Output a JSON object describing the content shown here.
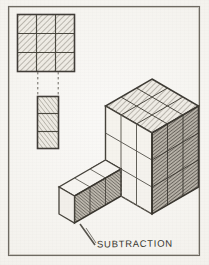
{
  "sheet": {
    "medium": "pencil-on-paper",
    "paper_color": "#f3f1ec",
    "ink_color": "#3a3832",
    "border_color": "#6b675f"
  },
  "caption": {
    "text": "SUBTRACTION",
    "x": 97,
    "y": 238
  },
  "figures": {
    "plan_square": {
      "label": "plan-3x3-square",
      "grid_cols": 3,
      "grid_rows": 3,
      "x": 17,
      "y": 14,
      "w": 58,
      "h": 58,
      "fill": "hatched"
    },
    "removed_strip": {
      "label": "removed-1x3-strip",
      "grid_cols": 1,
      "grid_rows": 3,
      "x": 37,
      "y": 96,
      "w": 22,
      "h": 53,
      "fill": "hatched"
    },
    "connectors": {
      "label": "dashed-projection-lines",
      "count": 2,
      "style": "dashed",
      "x1": 38,
      "x2": 58,
      "y_top": 72,
      "y_bottom": 96
    },
    "isometric_mass": {
      "label": "isometric-cube-with-subtraction",
      "top_face": {
        "grid": "3x3",
        "fill": "hatched-light"
      },
      "right_face": {
        "grid": "3x3",
        "fill": "hatched-dark"
      },
      "left_face": {
        "grid": "3x3",
        "fill": "outline-only"
      },
      "subtracted_wing": {
        "grid": "3x1",
        "front_face": "hatched-dark",
        "top_face": "outline-only"
      }
    }
  },
  "frame": {
    "label": "drawing-border",
    "x": 8,
    "y": 6,
    "w": 192,
    "h": 250
  }
}
